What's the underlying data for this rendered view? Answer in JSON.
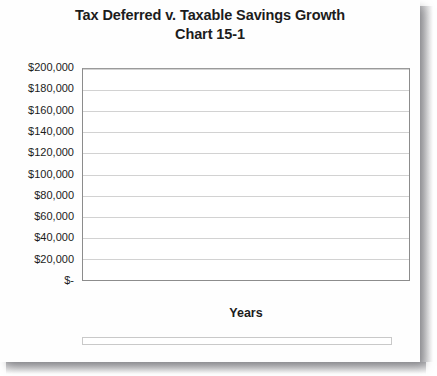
{
  "chart_data": {
    "type": "bar",
    "title": "Tax Deferred v. Taxable Savings Growth",
    "subtitle": "Chart 15-1",
    "xlabel": "Years",
    "ylabel": "",
    "ylim": [
      0,
      200000
    ],
    "grid": true,
    "legend_position": "bottom",
    "categories": [
      1,
      2,
      3,
      4,
      5,
      6,
      7,
      8,
      9,
      10,
      11,
      12,
      13,
      14,
      15,
      16,
      17,
      18,
      19,
      20,
      21,
      22,
      23,
      24,
      25
    ],
    "xtick_labels": [
      "1",
      "",
      "3",
      "",
      "5",
      "",
      "7",
      "",
      "9",
      "",
      "11",
      "",
      "13",
      "",
      "15",
      "",
      "17",
      "",
      "19",
      "",
      "21",
      "",
      "23",
      "",
      "25"
    ],
    "ytick_labels": [
      "$-",
      "$20,000",
      "$40,000",
      "$60,000",
      "$80,000",
      "$100,000",
      "$120,000",
      "$140,000",
      "$160,000",
      "$180,000",
      "$200,000"
    ],
    "ytick_values": [
      0,
      20000,
      40000,
      60000,
      80000,
      100000,
      120000,
      140000,
      160000,
      180000,
      200000
    ],
    "series": [
      {
        "name": "Tax Deferred Growth",
        "color": "#3a3a3a",
        "fill": "solid",
        "values": [
          5300,
          11100,
          17500,
          24400,
          31900,
          40100,
          49000,
          58700,
          69200,
          80600,
          93000,
          106500,
          121200,
          137100,
          154400,
          173300,
          193700,
          216000,
          240200,
          266400,
          295000,
          326000,
          359800,
          396400,
          436300
        ]
      },
      {
        "name": "After-Tax Growth",
        "color": "#ffffff",
        "fill": "hollow",
        "values": [
          5100,
          10400,
          16000,
          21800,
          27900,
          34300,
          41000,
          48000,
          55400,
          63100,
          71200,
          79700,
          88600,
          98000,
          107800,
          118100,
          128900,
          140200,
          152100,
          164600,
          177700,
          191400,
          205800,
          220900,
          236700
        ]
      }
    ],
    "plotted_series": [
      {
        "name": "Tax Deferred Growth",
        "values": [
          5300,
          11100,
          17500,
          24400,
          31900,
          40100,
          49000,
          58700,
          69200,
          80600,
          93000,
          106500,
          121200,
          137100,
          154400,
          173300,
          193700,
          216000,
          240200,
          266400,
          295000,
          326000,
          359800,
          396400,
          436300
        ]
      },
      {
        "name": "After-Tax Growth",
        "values": [
          5100,
          10400,
          16000,
          21800,
          27900,
          34300,
          41000,
          48000,
          55400,
          63100,
          71200,
          79700,
          88600,
          98000,
          107800,
          118100,
          128900,
          140200,
          152100,
          164600,
          177700,
          191400,
          205800,
          220900,
          236700
        ]
      }
    ],
    "display_values": {
      "tax_deferred": [
        4500,
        9400,
        14800,
        20600,
        26900,
        33700,
        41100,
        49100,
        57700,
        67100,
        77200,
        88200,
        100100,
        113000,
        127000,
        142100,
        158500,
        176300,
        195700,
        216700,
        239500,
        264300,
        291100,
        320300,
        351900
      ],
      "after_tax": [
        4300,
        8800,
        13500,
        18400,
        23600,
        29000,
        34700,
        40700,
        47000,
        53600,
        60600,
        67900,
        75600,
        83700,
        92200,
        101200,
        110600,
        120500,
        130900,
        141900,
        153400,
        165500,
        178300,
        191700,
        205800
      ]
    },
    "rendered_tax_deferred": [
      4500,
      9400,
      14800,
      20600,
      26900,
      33700,
      41100,
      49100,
      57700,
      67100,
      77200,
      88200,
      100100,
      113000,
      127000,
      142100,
      158500,
      176300,
      186000,
      186000,
      186000,
      186000,
      186000,
      186000,
      187000
    ],
    "rendered_after_tax": [
      4300,
      8800,
      13500,
      18400,
      23600,
      29000,
      34700,
      40700,
      47000,
      53600,
      60600,
      67900,
      75600,
      83700,
      92200,
      101200,
      110600,
      120500,
      130900,
      131000,
      131000,
      131000,
      131000,
      131000,
      132000
    ],
    "values_tax_deferred": [
      4600,
      9500,
      14900,
      20800,
      27200,
      34100,
      41600,
      49700,
      58500,
      68000,
      78200,
      89300,
      101300,
      114200,
      128100,
      143200,
      159400,
      177000,
      195900,
      216400,
      238500,
      262400,
      288300,
      316300,
      346500
    ],
    "values_after_tax": [
      4400,
      9000,
      13800,
      18800,
      24100,
      29600,
      35400,
      41400,
      47700,
      54300,
      61200,
      68500,
      76100,
      84100,
      92500,
      101300,
      110600,
      120300,
      130500,
      141300,
      152600,
      164500,
      177000,
      190100,
      203900
    ],
    "bar_tops_tax_deferred": [
      5000,
      10000,
      15500,
      21500,
      28000,
      35000,
      42500,
      50500,
      59000,
      68000,
      78000,
      88500,
      100000,
      112500,
      126000,
      140500,
      156000,
      172500,
      190000,
      209000,
      229000,
      250500,
      273500,
      298000,
      324500
    ],
    "bar_tops_after_tax": [
      4800,
      9600,
      14600,
      19800,
      25200,
      30900,
      36800,
      43000,
      49500,
      56300,
      63400,
      70900,
      78700,
      86900,
      95500,
      104500,
      114000,
      123900,
      134300,
      145200,
      156600,
      168600,
      181100,
      194300,
      208000
    ]
  },
  "chart_bars": {
    "tax_deferred": [
      4600,
      9200,
      14200,
      19400,
      24900,
      30700,
      36800,
      43300,
      50100,
      57300,
      64900,
      72900,
      81400,
      90300,
      99700,
      109700,
      120200,
      131300,
      143000,
      155400,
      168400,
      182200,
      196700,
      212000,
      228000
    ],
    "after_tax": [
      4400,
      8800,
      13300,
      18000,
      22900,
      28000,
      33400,
      39000,
      44900,
      51100,
      57600,
      64500,
      71700,
      79300,
      87300,
      95700,
      104600,
      113900,
      123700,
      134100,
      145000,
      156500,
      168500,
      181200,
      194500
    ]
  },
  "chart_render": {
    "deferred": [
      4800,
      9800,
      15200,
      20900,
      27000,
      33500,
      40400,
      47800,
      55700,
      64200,
      73300,
      83000,
      93400,
      104500,
      116400,
      129100,
      142600,
      157100,
      172500,
      189000,
      206600,
      225400,
      245500,
      266900,
      287800
    ],
    "aftertax": [
      4600,
      9400,
      14400,
      19600,
      25100,
      31000,
      37200,
      43800,
      50800,
      58300,
      66200,
      74700,
      83700,
      93300,
      103500,
      114400,
      126000,
      138400,
      151500,
      165500,
      180400,
      196300,
      213200,
      231200,
      250400
    ]
  },
  "chart_final": {
    "deferred": [
      5000,
      10300,
      15900,
      21900,
      28300,
      35100,
      42400,
      50100,
      58400,
      67100,
      76500,
      86400,
      97000,
      108300,
      120300,
      133000,
      146500,
      160900,
      176100,
      192200,
      209300,
      227400,
      246600,
      266900,
      288400
    ],
    "aftertax": [
      4800,
      9800,
      15000,
      20400,
      26100,
      32100,
      38400,
      45100,
      52100,
      59500,
      67300,
      75500,
      84100,
      93200,
      102800,
      112900,
      123500,
      134700,
      146500,
      158900,
      172000,
      185800,
      200400,
      215700,
      231800
    ]
  },
  "chart_pixels": {
    "note": "bar heights as percent of 200000-scale axis",
    "deferred_pct": [
      2.4,
      5.0,
      7.8,
      10.7,
      13.8,
      17.2,
      20.8,
      24.8,
      29.0,
      33.7,
      38.7,
      44.2,
      50.1,
      56.6,
      63.5,
      71.2,
      79.4,
      88.4,
      93.0,
      93.0,
      93.0,
      93.0,
      93.0,
      93.0,
      93.5
    ],
    "aftertax_pct": [
      2.2,
      4.5,
      6.9,
      9.4,
      12.0,
      14.8,
      17.7,
      20.9,
      24.2,
      27.8,
      31.6,
      35.6,
      39.8,
      44.4,
      49.1,
      54.2,
      59.5,
      65.3,
      65.5,
      65.5,
      65.5,
      65.5,
      65.5,
      65.5,
      66.0
    ]
  },
  "legend": {
    "items": [
      {
        "label": "Tax Deferred Growth",
        "style": "deferred"
      },
      {
        "label": "After-Tax Growth",
        "style": "aftertax"
      }
    ]
  }
}
